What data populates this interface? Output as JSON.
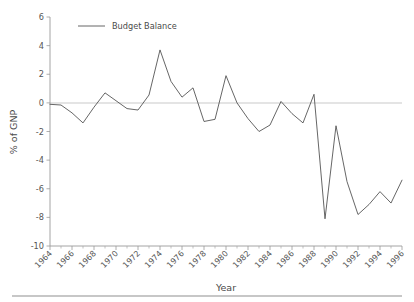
{
  "chart_data": {
    "type": "line",
    "title": "",
    "xlabel": "Year",
    "ylabel": "% of GNP",
    "xlim": [
      1964,
      1996
    ],
    "ylim": [
      -10,
      6
    ],
    "grid": false,
    "zero_reference_line": true,
    "legend_position": "top-left-inside",
    "series": [
      {
        "name": "Budget Balance",
        "color": "#555555",
        "x": [
          1964,
          1965,
          1966,
          1967,
          1968,
          1969,
          1970,
          1971,
          1972,
          1973,
          1974,
          1975,
          1976,
          1977,
          1978,
          1979,
          1980,
          1981,
          1982,
          1983,
          1984,
          1985,
          1986,
          1987,
          1988,
          1989,
          1990,
          1991,
          1992,
          1993,
          1994,
          1995,
          1996
        ],
        "values": [
          -0.1,
          -0.15,
          -0.7,
          -1.4,
          -0.3,
          0.7,
          0.15,
          -0.4,
          -0.5,
          0.55,
          3.7,
          1.5,
          0.4,
          1.05,
          -1.3,
          -1.15,
          1.9,
          0.0,
          -1.1,
          -2.0,
          -1.55,
          0.1,
          -0.75,
          -1.4,
          0.6,
          -8.1,
          -1.6,
          -5.5,
          -7.8,
          -7.1,
          -6.2,
          -7.0,
          -5.4
        ]
      }
    ],
    "y_ticks": [
      6,
      4,
      2,
      0,
      -2,
      -4,
      -6,
      -8,
      -10
    ],
    "y_tick_labels": [
      "6",
      "4",
      "2",
      "0",
      "-2",
      "-4",
      "-6",
      "-8",
      "-10"
    ],
    "x_major_ticks": [
      1964,
      1966,
      1968,
      1970,
      1972,
      1974,
      1976,
      1978,
      1980,
      1982,
      1984,
      1986,
      1988,
      1990,
      1992,
      1994,
      1996
    ],
    "x_major_tick_labels": [
      "1964",
      "1966",
      "1968",
      "1970",
      "1972",
      "1974",
      "1976",
      "1978",
      "1980",
      "1982",
      "1984",
      "1986",
      "1988",
      "1990",
      "1992",
      "1994",
      "1996"
    ],
    "x_minor_ticks": [
      1965,
      1967,
      1969,
      1971,
      1973,
      1975,
      1977,
      1979,
      1981,
      1983,
      1985,
      1987,
      1989,
      1991,
      1993,
      1995
    ],
    "legend_entries": [
      "Budget Balance"
    ]
  },
  "legend": {
    "entry_label": "Budget Balance"
  },
  "axes": {
    "y_title": "% of GNP",
    "x_title": "Year"
  },
  "colors": {
    "line": "#555555",
    "axis": "#9a9a9a",
    "zero_line": "#c9c9c9",
    "text": "#4a4a4a",
    "footer_rule": "#b5b5b5",
    "background": "#ffffff"
  }
}
